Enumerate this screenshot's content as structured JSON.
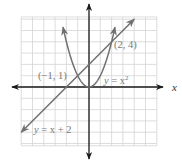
{
  "chart_data": {
    "type": "line",
    "title": "",
    "xlabel": "x",
    "ylabel": "",
    "xlim": [
      -6,
      6
    ],
    "ylim": [
      -5.2,
      6.2
    ],
    "grid": true,
    "legend": null,
    "series": [
      {
        "name": "y = x^2",
        "kind": "parabola",
        "x": [
          -2.3,
          -2,
          -1.5,
          -1,
          -0.5,
          0,
          0.5,
          1,
          1.5,
          2,
          2.3
        ],
        "values": [
          5.29,
          4,
          2.25,
          1,
          0.25,
          0,
          0.25,
          1,
          2.25,
          4,
          5.29
        ],
        "color": "#707070"
      },
      {
        "name": "y = x + 2",
        "kind": "line",
        "x": [
          -6,
          4
        ],
        "values": [
          -4,
          6
        ],
        "color": "#707070"
      }
    ],
    "annotations": [
      {
        "text": "(−1, 1)",
        "x": -1,
        "y": 1
      },
      {
        "text": "(2, 4)",
        "x": 2,
        "y": 4
      },
      {
        "text": "y = x²",
        "target": "parabola"
      },
      {
        "text": "y = x + 2",
        "target": "line"
      }
    ]
  },
  "labels": {
    "x_axis": "x",
    "point_a": "(−1, 1)",
    "point_b": "(2, 4)",
    "parabola_y": "y",
    "parabola_eq": " = x",
    "parabola_exp": "2",
    "line_y": "y",
    "line_eq": " = x + 2"
  },
  "colors": {
    "grid": "#d4d4d4",
    "axis": "#1a1a1a",
    "curve": "#707070",
    "label": "#7a7a7a"
  }
}
